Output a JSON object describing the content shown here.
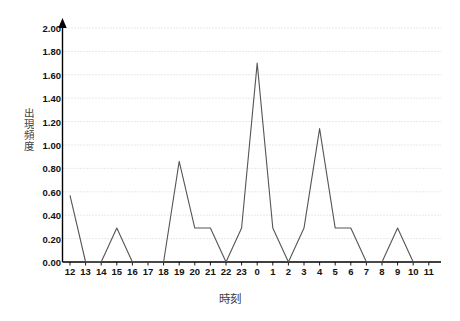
{
  "chart_data": {
    "type": "line",
    "title": "",
    "xlabel": "時刻",
    "ylabel": "出現頻度",
    "categories": [
      "12",
      "13",
      "14",
      "15",
      "16",
      "17",
      "18",
      "19",
      "20",
      "21",
      "22",
      "23",
      "0",
      "1",
      "2",
      "3",
      "4",
      "5",
      "6",
      "7",
      "8",
      "9",
      "10",
      "11"
    ],
    "values": [
      0.57,
      0.0,
      0.0,
      0.29,
      0.0,
      0.0,
      0.0,
      0.86,
      0.29,
      0.29,
      0.0,
      0.29,
      1.7,
      0.29,
      0.0,
      0.29,
      1.14,
      0.29,
      0.29,
      0.0,
      0.0,
      0.29,
      0.0,
      0.0
    ],
    "ylim": [
      0.0,
      2.0
    ],
    "ytick_values": [
      0.0,
      0.2,
      0.4,
      0.6,
      0.8,
      1.0,
      1.2,
      1.4,
      1.6,
      1.8,
      2.0
    ],
    "ytick_labels": [
      "0.00",
      "0.20",
      "0.40",
      "0.60",
      "0.80",
      "1.00",
      "1.20",
      "1.40",
      "1.60",
      "1.80",
      "2.00"
    ],
    "grid": true,
    "grid_axis": "y",
    "legend": false,
    "legend_position": "none",
    "series_color": "#555555",
    "grid_color": "#c8c8c8",
    "axis_color": "#000000",
    "background": "#ffffff",
    "axis_arrow": true
  }
}
